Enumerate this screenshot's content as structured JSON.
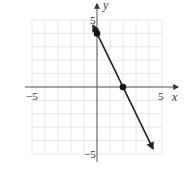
{
  "chart_data": {
    "type": "line",
    "title": "",
    "xlabel": "x",
    "ylabel": "y",
    "xlim": [
      -5,
      5
    ],
    "ylim": [
      -5,
      5
    ],
    "grid": true,
    "x_ticks_labeled": [
      "-5",
      "5"
    ],
    "y_ticks_labeled": [
      "5",
      "-5"
    ],
    "series": [
      {
        "name": "line",
        "equation": "y = -2x + 4",
        "x": [
          -0.3,
          4.3
        ],
        "y": [
          4.6,
          -4.6
        ],
        "arrows": "both ends"
      }
    ],
    "points": [
      {
        "x": 0,
        "y": 4,
        "label": "y-intercept"
      },
      {
        "x": 2,
        "y": 0,
        "label": "x-intercept"
      }
    ]
  },
  "labels": {
    "x_axis": "x",
    "y_axis": "y",
    "x_min": "−5",
    "x_max": "5",
    "y_max": "5",
    "y_min": "−5"
  },
  "colors": {
    "grid": "#e6e6e6",
    "axis": "#555555",
    "line": "#222222"
  }
}
